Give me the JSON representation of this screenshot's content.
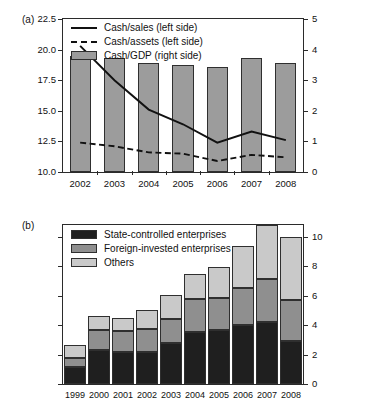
{
  "figure": {
    "panels": [
      {
        "id": "a",
        "label": "(a)"
      },
      {
        "id": "b",
        "label": "(b)"
      }
    ]
  },
  "chart_data": [
    {
      "type": "bar",
      "panel": "(a)",
      "title": "",
      "xlabel": "",
      "ylabel": "",
      "grid": false,
      "legend_position": "top-left inside plot",
      "categories": [
        "2002",
        "2003",
        "2004",
        "2005",
        "2006",
        "2007",
        "2008"
      ],
      "left_axis": {
        "ylim": [
          10.0,
          22.5
        ],
        "ticks": [
          "10.0",
          "12.5",
          "15.0",
          "17.5",
          "20.0",
          "22.5"
        ],
        "tick_values": [
          10.0,
          12.5,
          15.0,
          17.5,
          20.0,
          22.5
        ]
      },
      "right_axis": {
        "ylim": [
          0,
          5
        ],
        "ticks": [
          "0",
          "1",
          "2",
          "3",
          "4",
          "5"
        ],
        "tick_values": [
          0,
          1,
          2,
          3,
          4,
          5
        ]
      },
      "series": [
        {
          "name": "Cash/sales (left side)",
          "kind": "line",
          "style": "solid",
          "axis": "left",
          "color": "#111111",
          "values": [
            20.3,
            17.5,
            15.1,
            13.9,
            12.4,
            13.3,
            12.6
          ]
        },
        {
          "name": "Cash/assets (left side)",
          "kind": "line",
          "style": "dashed",
          "axis": "left",
          "color": "#111111",
          "values": [
            12.4,
            12.1,
            11.6,
            11.5,
            10.9,
            11.4,
            11.2
          ]
        },
        {
          "name": "Cash/GDP (right side)",
          "kind": "bar",
          "axis": "right",
          "color": "#9c9c9c",
          "values": [
            3.8,
            3.73,
            3.55,
            3.49,
            3.44,
            3.71,
            3.56
          ]
        }
      ]
    },
    {
      "type": "bar",
      "panel": "(b)",
      "title": "",
      "xlabel": "",
      "ylabel": "",
      "grid": false,
      "stacked": true,
      "legend_position": "top-left inside plot",
      "categories": [
        "1999",
        "2000",
        "2001",
        "2002",
        "2003",
        "2004",
        "2005",
        "2006",
        "2007",
        "2008"
      ],
      "right_axis": {
        "ylim": [
          0,
          10.8
        ],
        "ticks": [
          "0",
          "2",
          "4",
          "6",
          "8",
          "10"
        ],
        "tick_values": [
          0,
          2,
          4,
          6,
          8,
          10
        ]
      },
      "series": [
        {
          "name": "State-controlled enterprises",
          "color": "#1f1f1f",
          "values": [
            1.15,
            2.3,
            2.15,
            2.15,
            2.8,
            3.5,
            3.65,
            4.0,
            4.2,
            2.95
          ]
        },
        {
          "name": "Foreign-invested enterprises",
          "color": "#8f8f8f",
          "values": [
            0.6,
            1.35,
            1.45,
            1.6,
            1.6,
            2.3,
            2.2,
            2.55,
            2.9,
            2.75
          ]
        },
        {
          "name": "Others",
          "color": "#c9c9c9",
          "values": [
            0.9,
            0.95,
            0.9,
            1.3,
            1.65,
            1.7,
            2.1,
            2.85,
            3.7,
            4.3
          ]
        }
      ],
      "totals": [
        2.65,
        4.6,
        4.5,
        5.05,
        6.05,
        7.5,
        7.95,
        9.4,
        10.8,
        10.0
      ]
    }
  ]
}
